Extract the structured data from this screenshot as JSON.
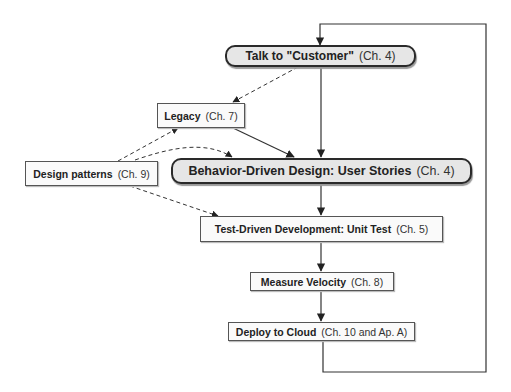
{
  "diagram": {
    "nodes": {
      "talk_customer": {
        "title": "Talk to \"Customer\"",
        "ref": "(Ch. 4)"
      },
      "legacy": {
        "title": "Legacy",
        "ref": "(Ch. 7)"
      },
      "design_patterns": {
        "title": "Design patterns",
        "ref": "(Ch. 9)"
      },
      "bdd": {
        "title": "Behavior-Driven Design: User Stories",
        "ref": "(Ch. 4)"
      },
      "tdd": {
        "title": "Test-Driven Development: Unit Test",
        "ref": "(Ch. 5)"
      },
      "velocity": {
        "title": "Measure Velocity",
        "ref": "(Ch. 8)"
      },
      "deploy": {
        "title": "Deploy to Cloud",
        "ref": "(Ch. 10 and Ap. A)"
      }
    },
    "edges": [
      {
        "from": "talk_customer",
        "to": "bdd",
        "style": "solid"
      },
      {
        "from": "talk_customer",
        "to": "legacy",
        "style": "dashed"
      },
      {
        "from": "legacy",
        "to": "bdd",
        "style": "solid"
      },
      {
        "from": "design_patterns",
        "to": "legacy",
        "style": "dashed"
      },
      {
        "from": "design_patterns",
        "to": "bdd",
        "style": "dashed"
      },
      {
        "from": "design_patterns",
        "to": "tdd",
        "style": "dashed"
      },
      {
        "from": "bdd",
        "to": "tdd",
        "style": "solid"
      },
      {
        "from": "tdd",
        "to": "velocity",
        "style": "solid"
      },
      {
        "from": "velocity",
        "to": "deploy",
        "style": "solid"
      },
      {
        "from": "deploy",
        "to": "talk_customer",
        "style": "solid",
        "note": "feedback loop"
      }
    ],
    "colors": {
      "line": "#333333",
      "pill_fill": "#e6e6e6",
      "box_fill": "#fafafa"
    }
  }
}
